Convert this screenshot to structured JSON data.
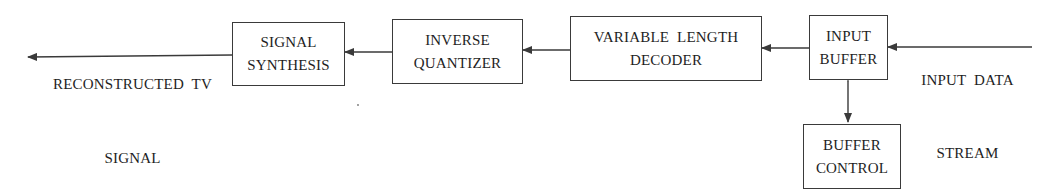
{
  "diagram": {
    "type": "block-diagram",
    "blocks": [
      {
        "id": "signal_synthesis",
        "lines": [
          "SIGNAL",
          "SYNTHESIS"
        ]
      },
      {
        "id": "inverse_quantizer",
        "lines": [
          "INVERSE",
          "QUANTIZER"
        ]
      },
      {
        "id": "variable_length_decoder",
        "lines": [
          "VARIABLE  LENGTH",
          "DECODER"
        ]
      },
      {
        "id": "input_buffer",
        "lines": [
          "INPUT",
          "BUFFER"
        ]
      },
      {
        "id": "buffer_control",
        "lines": [
          "BUFFER",
          "CONTROL"
        ]
      }
    ],
    "input_label": [
      "INPUT  DATA",
      "STREAM"
    ],
    "output_label": [
      "RECONSTRUCTED  TV",
      "SIGNAL"
    ],
    "edges": [
      {
        "from": "input_data_stream",
        "to": "input_buffer",
        "style": "arrow"
      },
      {
        "from": "input_buffer",
        "to": "variable_length_decoder",
        "style": "arrow"
      },
      {
        "from": "variable_length_decoder",
        "to": "inverse_quantizer",
        "style": "arrow"
      },
      {
        "from": "inverse_quantizer",
        "to": "signal_synthesis",
        "style": "arrow"
      },
      {
        "from": "signal_synthesis",
        "to": "reconstructed_tv_signal",
        "style": "arrow"
      },
      {
        "from": "input_buffer",
        "to": "buffer_control",
        "style": "bidirectional-arrow"
      }
    ],
    "colors": {
      "line": "#3a3a3a",
      "text": "#1e1e1e",
      "background": "#ffffff"
    }
  }
}
